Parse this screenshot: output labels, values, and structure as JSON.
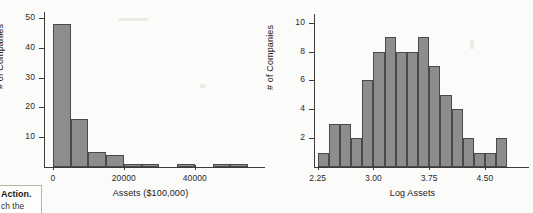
{
  "page": {
    "margin_note_line1": "Action.",
    "margin_note_line2": "ch the"
  },
  "chart_data": [
    {
      "id": "assets-histogram",
      "type": "bar",
      "title": "",
      "xlabel": "Assets ($100,000)",
      "ylabel": "# of Companies",
      "xlim": [
        -2500,
        57500
      ],
      "ylim": [
        0,
        52
      ],
      "grid": false,
      "legend": "none",
      "bin_width": 5000,
      "x_ticks": [
        0,
        20000,
        40000
      ],
      "x_tick_labels": [
        "0",
        "20000",
        "40000"
      ],
      "y_ticks": [
        10,
        20,
        30,
        40,
        50
      ],
      "y_tick_labels": [
        "10",
        "20",
        "30",
        "40",
        "50"
      ],
      "bin_starts": [
        0,
        5000,
        10000,
        15000,
        20000,
        25000,
        30000,
        35000,
        40000,
        45000,
        50000,
        55000
      ],
      "values": [
        48,
        16,
        5,
        4,
        1,
        1,
        0,
        1,
        0,
        1,
        1,
        0
      ]
    },
    {
      "id": "log-assets-histogram",
      "type": "bar",
      "title": "",
      "xlabel": "Log Assets",
      "ylabel": "# of Companies",
      "xlim": [
        2.2,
        4.85
      ],
      "ylim": [
        0,
        10.6
      ],
      "grid": false,
      "legend": "none",
      "bin_width": 0.15,
      "x_ticks": [
        2.25,
        3.0,
        3.75,
        4.5
      ],
      "x_tick_labels": [
        "2.25",
        "3.00",
        "3.75",
        "4.50"
      ],
      "y_ticks": [
        2,
        4,
        6,
        8,
        10
      ],
      "y_tick_labels": [
        "2",
        "4",
        "6",
        "8",
        "10"
      ],
      "bin_starts": [
        2.25,
        2.4,
        2.55,
        2.7,
        2.85,
        3.0,
        3.15,
        3.3,
        3.45,
        3.6,
        3.75,
        3.9,
        4.05,
        4.2,
        4.35,
        4.5,
        4.65
      ],
      "values": [
        1,
        3,
        3,
        2,
        6,
        8,
        9,
        8,
        8,
        9,
        7,
        5,
        4,
        2,
        1,
        1,
        2
      ]
    }
  ]
}
